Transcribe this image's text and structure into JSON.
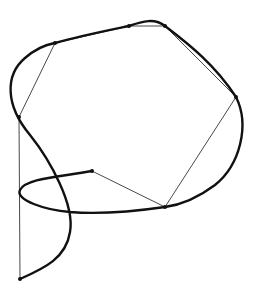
{
  "diagram": {
    "type": "spline-with-control-polygon",
    "colors": {
      "background": "#ffffff",
      "curve": "#111111",
      "polygon": "#333333",
      "vertex": "#111111"
    },
    "control_points": [
      {
        "x": 20,
        "y": 279
      },
      {
        "x": 19,
        "y": 117
      },
      {
        "x": 55,
        "y": 43
      },
      {
        "x": 129,
        "y": 26
      },
      {
        "x": 165,
        "y": 26
      },
      {
        "x": 236,
        "y": 97
      },
      {
        "x": 165,
        "y": 207
      },
      {
        "x": 92,
        "y": 171
      }
    ],
    "curve_path": "M20,279 C45,268 66,258 70,232 C75,205 50,160 30,135 C5,105 5,75 25,58 C40,45 50,44 55,43 C80,36 105,31 129,26 C143,21 155,18 165,26 C190,45 215,65 236,97 C250,125 240,165 215,185 C195,200 180,205 165,207 C130,212 95,214 70,212 C45,210 15,200 20,190 C26,178 60,177 92,171"
  }
}
